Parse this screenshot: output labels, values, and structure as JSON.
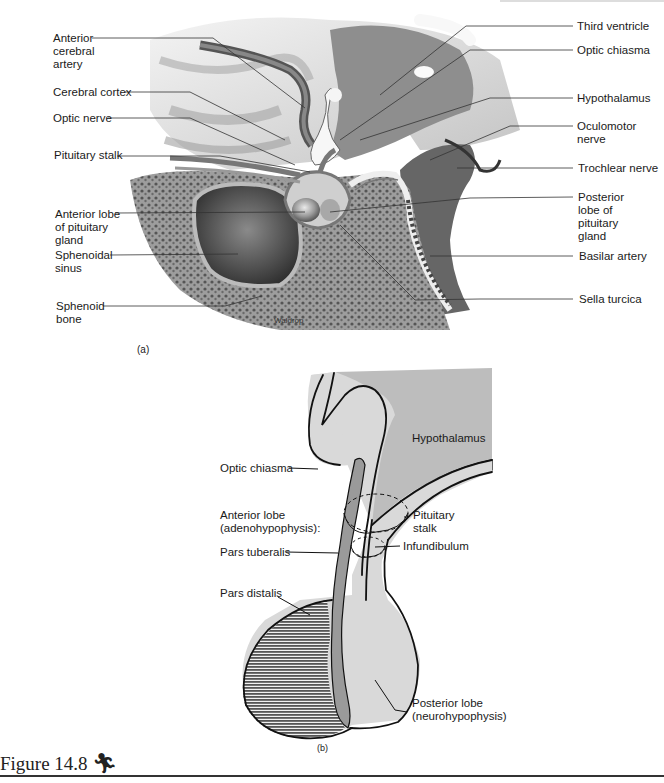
{
  "figure": {
    "number_label": "Figure 14.8",
    "icon": "running-figure-icon",
    "caption_glyph": "Ŷ"
  },
  "panel_a": {
    "panel_label": "(a)",
    "artist_signature": "Waldrop",
    "left_labels": [
      {
        "text": "Anterior cerebral artery",
        "lines": [
          "Anterior",
          "cerebral",
          "artery"
        ]
      },
      {
        "text": "Cerebral cortex",
        "lines": [
          "Cerebral cortex"
        ]
      },
      {
        "text": "Optic nerve",
        "lines": [
          "Optic nerve"
        ]
      },
      {
        "text": "Pituitary stalk",
        "lines": [
          "Pituitary stalk"
        ]
      },
      {
        "text": "Anterior lobe of pituitary gland",
        "lines": [
          "Anterior lobe",
          "of pituitary",
          "gland"
        ]
      },
      {
        "text": "Sphenoidal sinus",
        "lines": [
          "Sphenoidal",
          "sinus"
        ]
      },
      {
        "text": "Sphenoid bone",
        "lines": [
          "Sphenoid",
          "bone"
        ]
      }
    ],
    "right_labels": [
      {
        "text": "Third ventricle",
        "lines": [
          "Third ventricle"
        ]
      },
      {
        "text": "Optic chiasma",
        "lines": [
          "Optic chiasma"
        ]
      },
      {
        "text": "Hypothalamus",
        "lines": [
          "Hypothalamus"
        ]
      },
      {
        "text": "Oculomotor nerve",
        "lines": [
          "Oculomotor",
          "nerve"
        ]
      },
      {
        "text": "Trochlear nerve",
        "lines": [
          "Trochlear nerve"
        ]
      },
      {
        "text": "Posterior lobe of pituitary gland",
        "lines": [
          "Posterior",
          "lobe of",
          "pituitary",
          "gland"
        ]
      },
      {
        "text": "Basilar artery",
        "lines": [
          "Basilar artery"
        ]
      },
      {
        "text": "Sella turcica",
        "lines": [
          "Sella turcica"
        ]
      }
    ]
  },
  "panel_b": {
    "panel_label": "(b)",
    "labels": {
      "hypothalamus": "Hypothalamus",
      "optic_chiasma": "Optic chiasma",
      "anterior_lobe": [
        "Anterior lobe",
        "(adenohypophysis):"
      ],
      "pars_tuberalis": "Pars tuberalis",
      "pars_distalis": "Pars distalis",
      "pituitary_stalk": [
        "Pituitary",
        "stalk"
      ],
      "infundibulum": "Infundibulum",
      "posterior_lobe": [
        "Posterior lobe",
        "(neurohypophysis)"
      ]
    },
    "colors": {
      "hypothalamus_fill": "#bdbdbd",
      "light_tissue_fill": "#d9d9d9",
      "pars_tuberalis_fill": "#9a9a9a",
      "pars_distalis_hatch": "#555555",
      "outline": "#111111"
    }
  }
}
